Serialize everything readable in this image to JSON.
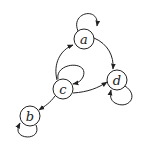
{
  "diagram": {
    "type": "directed-graph",
    "nodes": [
      {
        "id": "a",
        "label": "a"
      },
      {
        "id": "b",
        "label": "b"
      },
      {
        "id": "c",
        "label": "c"
      },
      {
        "id": "d",
        "label": "d"
      }
    ],
    "edges": [
      {
        "from": "a",
        "to": "a"
      },
      {
        "from": "a",
        "to": "d"
      },
      {
        "from": "c",
        "to": "a"
      },
      {
        "from": "c",
        "to": "c"
      },
      {
        "from": "c",
        "to": "d"
      },
      {
        "from": "c",
        "to": "b"
      },
      {
        "from": "d",
        "to": "d"
      },
      {
        "from": "b",
        "to": "b"
      }
    ]
  }
}
